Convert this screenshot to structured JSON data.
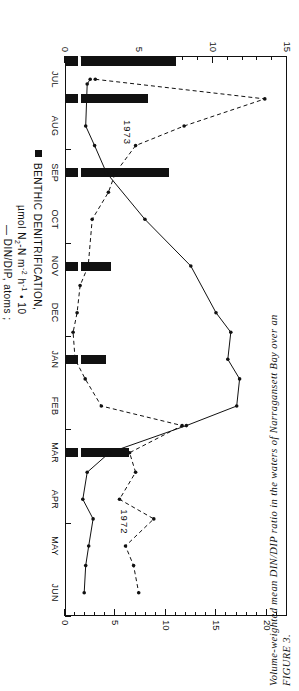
{
  "figure": {
    "caption_label": "FIGURE 3.",
    "caption_line1": "Volume-weighted mean DIN/DIP ratio in the waters of Narragansett Bay over an"
  },
  "axes": {
    "left_title_main": "BENTHIC DENITRIFICATION,",
    "left_title_units_pre": "µmol N",
    "left_title_units_sub1": "2",
    "left_title_units_mid": "-N m",
    "left_title_units_sup1": "-2",
    "left_title_units_h": " h",
    "left_title_units_sup2": "-1",
    "left_title_units_post": " • 10",
    "left_legend_din": "— DIN/DIP, atoms ;",
    "right_title": "CHLOROPHYLL A, mg m",
    "right_title_sup": "-3",
    "left_ticks": [
      "0",
      "5",
      "10",
      "15"
    ],
    "right_ticks": [
      "0",
      "5",
      "10",
      "15",
      "20"
    ],
    "left_range": [
      0,
      15
    ],
    "right_range": [
      0,
      22
    ],
    "months": [
      "JAN",
      "FEB",
      "MAR",
      "APR",
      "MAY",
      "JUN",
      "JUL",
      "AUG",
      "SEP",
      "OCT",
      "NOV",
      "DEC"
    ],
    "year_left": "1973",
    "year_right": "1972"
  },
  "chart_data": {
    "type": "line",
    "title": "Volume-weighted mean DIN/DIP ratio in the waters of Narragansett Bay",
    "xlabel": "",
    "ylabel": "BENTHIC DENITRIFICATION, µmol N2-N m-2 h-1 • 10",
    "y2label": "CHLOROPHYLL A, mg m-3",
    "ylim": [
      0,
      15
    ],
    "y2lim": [
      0,
      22
    ],
    "grid": false,
    "legend_position": "below-axis",
    "x_order_note": "Axis runs JUL(1972) through JUN(1973); screenshot reads right-to-left when rotated",
    "categories": [
      "JUL",
      "AUG",
      "SEP",
      "OCT",
      "NOV",
      "DEC",
      "JAN",
      "FEB",
      "MAR",
      "APR",
      "MAY",
      "JUN"
    ],
    "series": [
      {
        "name": "DIN/DIP, atoms",
        "style": "solid-line-with-dots",
        "axis": "left",
        "values": [
          1.6,
          1.4,
          2.6,
          5.2,
          8.4,
          11.0,
          11.3,
          11.8,
          8.6,
          2.4,
          1.6,
          1.3
        ],
        "points_detail": [
          {
            "x": "JUL",
            "y": 1.7
          },
          {
            "x": "JUL-mid",
            "y": 1.5
          },
          {
            "x": "AUG",
            "y": 1.4
          },
          {
            "x": "AUG-late",
            "y": 2.0
          },
          {
            "x": "SEP",
            "y": 2.8
          },
          {
            "x": "OCT",
            "y": 5.4
          },
          {
            "x": "NOV",
            "y": 8.5
          },
          {
            "x": "DEC",
            "y": 10.2
          },
          {
            "x": "DEC-late",
            "y": 11.2
          },
          {
            "x": "JAN",
            "y": 11.0
          },
          {
            "x": "JAN-late",
            "y": 11.8
          },
          {
            "x": "FEB",
            "y": 11.6
          },
          {
            "x": "FEB-late",
            "y": 8.2
          },
          {
            "x": "MAR",
            "y": 3.0
          },
          {
            "x": "MAR-late",
            "y": 1.5
          },
          {
            "x": "APR",
            "y": 1.2
          },
          {
            "x": "APR-late",
            "y": 1.9
          },
          {
            "x": "MAY",
            "y": 1.6
          },
          {
            "x": "MAY-late",
            "y": 1.4
          },
          {
            "x": "JUN",
            "y": 1.3
          }
        ]
      },
      {
        "name": "CHLOROPHYLL A",
        "style": "dashed-line-with-dots",
        "axis": "right",
        "values": [
          19.5,
          12.0,
          7.5,
          4.2,
          2.6,
          1.4,
          0.9,
          3.5,
          11.5,
          6.6,
          9.0,
          7.2
        ],
        "points_detail": [
          {
            "x": "JUL",
            "y": 3.0
          },
          {
            "x": "JUL-late",
            "y": 19.8
          },
          {
            "x": "AUG",
            "y": 11.8
          },
          {
            "x": "AUG-late",
            "y": 7.0
          },
          {
            "x": "SEP",
            "y": 5.0
          },
          {
            "x": "SEP-late",
            "y": 4.3
          },
          {
            "x": "OCT",
            "y": 2.7
          },
          {
            "x": "NOV",
            "y": 2.3
          },
          {
            "x": "NOV-late",
            "y": 1.5
          },
          {
            "x": "DEC",
            "y": 1.2
          },
          {
            "x": "DEC-late",
            "y": 0.8
          },
          {
            "x": "JAN",
            "y": 1.0
          },
          {
            "x": "JAN-late",
            "y": 2.0
          },
          {
            "x": "FEB",
            "y": 3.6
          },
          {
            "x": "FEB-late",
            "y": 11.6
          },
          {
            "x": "MAR",
            "y": 6.4
          },
          {
            "x": "MAR-late",
            "y": 7.0
          },
          {
            "x": "APR",
            "y": 5.4
          },
          {
            "x": "APR-late",
            "y": 8.8
          },
          {
            "x": "MAY",
            "y": 6.0
          },
          {
            "x": "MAY-late",
            "y": 6.8
          },
          {
            "x": "JUN",
            "y": 7.3
          }
        ]
      },
      {
        "name": "BENTHIC DENITRIFICATION",
        "style": "filled-bar",
        "axis": "left",
        "bars": [
          {
            "x": "JAN",
            "height": 2.8,
            "broken": true
          },
          {
            "x": "MAR",
            "height": 4.3,
            "broken": true
          },
          {
            "x": "JUL-early",
            "height": 7.5,
            "broken": true
          },
          {
            "x": "JUL-late",
            "height": 5.6,
            "broken": true
          },
          {
            "x": "SEP",
            "height": 7.0,
            "broken": true
          },
          {
            "x": "NOV",
            "height": 3.1,
            "broken": true
          }
        ]
      }
    ]
  }
}
